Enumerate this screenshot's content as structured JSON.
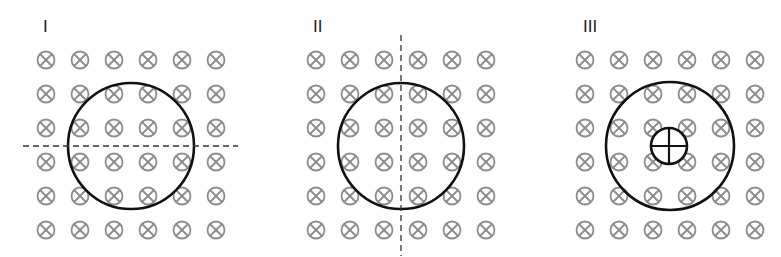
{
  "diagram": {
    "field_symbol": "into-page (⊗)",
    "field_color": "#8c8c8c",
    "loop_color": "#111111",
    "grid": {
      "rows": 6,
      "cols": 6,
      "spacing": 34
    },
    "panels": [
      {
        "label": "I",
        "label_pos": [
          43,
          18
        ],
        "grid_origin": [
          46,
          60
        ],
        "loop": {
          "cx": 131,
          "cy": 146,
          "r": 63
        },
        "axis": {
          "orientation": "horizontal",
          "x1": 23,
          "y1": 146,
          "x2": 238,
          "y2": 146
        }
      },
      {
        "label": "II",
        "label_pos": [
          313,
          18
        ],
        "grid_origin": [
          316,
          60
        ],
        "loop": {
          "cx": 401,
          "cy": 146,
          "r": 63
        },
        "axis": {
          "orientation": "vertical",
          "x1": 401,
          "y1": 35,
          "x2": 401,
          "y2": 256
        }
      },
      {
        "label": "III",
        "label_pos": [
          583,
          18
        ],
        "grid_origin": [
          585,
          60
        ],
        "loop": {
          "cx": 670,
          "cy": 146,
          "r": 64
        },
        "out_of_page_symbol": {
          "symbol": "⊕",
          "cx": 669,
          "cy": 146,
          "r": 18
        }
      }
    ]
  }
}
